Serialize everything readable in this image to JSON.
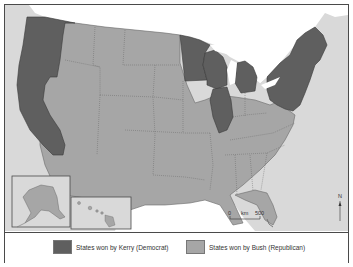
{
  "map": {
    "subject": "United States presidential election 2004 results by state",
    "colors": {
      "democrat": "#5f5f5f",
      "republican": "#a6a6a6",
      "water": "#ffffff",
      "land_outside": "#d9d9d9",
      "border": "#4a4a4a"
    },
    "kerry_states": [
      "WA",
      "OR",
      "CA",
      "MN",
      "WI",
      "MI",
      "IL",
      "PA",
      "NY",
      "VT",
      "NH",
      "ME",
      "MA",
      "RI",
      "CT",
      "NJ",
      "DE",
      "MD",
      "DC"
    ],
    "insets": [
      "Alaska",
      "Hawaii"
    ],
    "scale_bar": {
      "start": "0",
      "unit": "km",
      "end": "500"
    },
    "north_arrow": "N"
  },
  "legend": {
    "items": [
      {
        "label": "States won by Kerry (Democrat)",
        "color": "#5f5f5f"
      },
      {
        "label": "States won by Bush (Republican)",
        "color": "#a6a6a6"
      }
    ]
  }
}
